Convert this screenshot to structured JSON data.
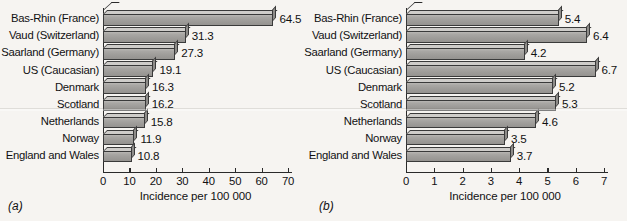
{
  "figure": {
    "panels": [
      {
        "id": "a",
        "label": "(a)",
        "chart_data": {
          "type": "bar",
          "orientation": "horizontal",
          "title": "",
          "xlabel": "Incidence per 100 000",
          "ylabel": "",
          "xlim": [
            0,
            70
          ],
          "xticks": [
            "0",
            "10",
            "20",
            "30",
            "40",
            "50",
            "60",
            "70"
          ],
          "grid": false,
          "legend": null,
          "categories": [
            "Bas-Rhin (France)",
            "Vaud (Switzerland)",
            "Saarland (Germany)",
            "US (Caucasian)",
            "Denmark",
            "Scotland",
            "Netherlands",
            "Norway",
            "England and Wales"
          ],
          "values": [
            64.5,
            31.3,
            27.3,
            19.1,
            16.3,
            16.2,
            15.8,
            11.9,
            10.8
          ],
          "value_labels": [
            "64.5",
            "31.3",
            "27.3",
            "19.1",
            "16.3",
            "16.2",
            "15.8",
            "11.9",
            "10.8"
          ]
        }
      },
      {
        "id": "b",
        "label": "(b)",
        "chart_data": {
          "type": "bar",
          "orientation": "horizontal",
          "title": "",
          "xlabel": "Incidence per 100 000",
          "ylabel": "",
          "xlim": [
            0,
            7
          ],
          "xticks": [
            "0",
            "1",
            "2",
            "3",
            "4",
            "5",
            "6",
            "7"
          ],
          "grid": false,
          "legend": null,
          "categories": [
            "Bas-Rhin (France)",
            "Vaud (Switzerland)",
            "Saarland (Germany)",
            "US (Caucasian)",
            "Denmark",
            "Scotland",
            "Netherlands",
            "Norway",
            "England and Wales"
          ],
          "values": [
            5.4,
            6.4,
            4.2,
            6.7,
            5.2,
            5.3,
            4.6,
            3.5,
            3.7
          ],
          "value_labels": [
            "5.4",
            "6.4",
            "4.2",
            "6.7",
            "5.2",
            "5.3",
            "4.6",
            "3.5",
            "3.7"
          ]
        }
      }
    ],
    "colors": {
      "background": "#f6f4f1",
      "bar_face": "#a3a19e",
      "bar_top": "#cfcdca",
      "bar_cap": "#8e8c89",
      "outline": "#3a3a3a",
      "text": "#111111"
    }
  }
}
